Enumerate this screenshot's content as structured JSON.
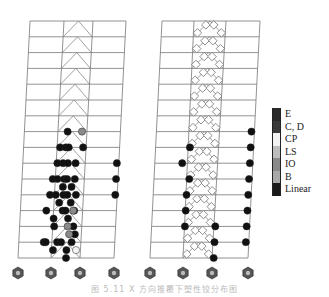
{
  "figure": {
    "caption": "图 5.11  X 方向推覆下塑性铰分布图",
    "stories": 15,
    "floor_top_y": 21,
    "floor_spacing": 15.8,
    "support_y": 273
  },
  "frames": [
    {
      "name": "left-frame",
      "top_cols": [
        30,
        64,
        93,
        126
      ],
      "bottom_cols": [
        18,
        51,
        80,
        114
      ],
      "brace_type": "chevron",
      "hinges": [
        {
          "story": 7,
          "x": 0.45,
          "s": "Linear"
        },
        {
          "story": 7,
          "x": 0.6,
          "s": "IO"
        },
        {
          "story": 8,
          "x": 0.38,
          "s": "Linear"
        },
        {
          "story": 8,
          "x": 0.44,
          "s": "Linear"
        },
        {
          "story": 8,
          "x": 0.47,
          "s": "Linear"
        },
        {
          "story": 8,
          "x": 0.62,
          "s": "Linear"
        },
        {
          "story": 9,
          "x": 0.36,
          "s": "Linear"
        },
        {
          "story": 9,
          "x": 0.42,
          "s": "Linear"
        },
        {
          "story": 9,
          "x": 0.47,
          "s": "Linear"
        },
        {
          "story": 9,
          "x": 0.55,
          "s": "Linear"
        },
        {
          "story": 9,
          "x": 0.98,
          "s": "Linear"
        },
        {
          "story": 10,
          "x": 0.32,
          "s": "Linear"
        },
        {
          "story": 10,
          "x": 0.37,
          "s": "Linear"
        },
        {
          "story": 10,
          "x": 0.44,
          "s": "Linear"
        },
        {
          "story": 10,
          "x": 0.47,
          "s": "Linear"
        },
        {
          "story": 10,
          "x": 0.55,
          "s": "Linear"
        },
        {
          "story": 10,
          "x": 0.98,
          "s": "Linear"
        },
        {
          "story": 10.5,
          "x": 0.43,
          "s": "Linear"
        },
        {
          "story": 10.5,
          "x": 0.52,
          "s": "Linear"
        },
        {
          "story": 11,
          "x": 0.3,
          "s": "Linear"
        },
        {
          "story": 11,
          "x": 0.36,
          "s": "Linear"
        },
        {
          "story": 11,
          "x": 0.44,
          "s": "Linear"
        },
        {
          "story": 11,
          "x": 0.48,
          "s": "Linear"
        },
        {
          "story": 11,
          "x": 0.57,
          "s": "Linear"
        },
        {
          "story": 11,
          "x": 0.98,
          "s": "Linear"
        },
        {
          "story": 11.5,
          "x": 0.4,
          "s": "Linear"
        },
        {
          "story": 11.5,
          "x": 0.52,
          "s": "Linear"
        },
        {
          "story": 12,
          "x": 0.27,
          "s": "Linear"
        },
        {
          "story": 12,
          "x": 0.44,
          "s": "Linear"
        },
        {
          "story": 12,
          "x": 0.47,
          "s": "Linear"
        },
        {
          "story": 12,
          "x": 0.56,
          "s": "Linear"
        },
        {
          "story": 12,
          "x": 0.55,
          "s": "IO"
        },
        {
          "story": 12.5,
          "x": 0.35,
          "s": "Linear"
        },
        {
          "story": 12.5,
          "x": 0.5,
          "s": "Linear"
        },
        {
          "story": 13,
          "x": 0.56,
          "s": "Linear"
        },
        {
          "story": 13,
          "x": 0.5,
          "s": "IO"
        },
        {
          "story": 13,
          "x": 0.36,
          "s": "Linear"
        },
        {
          "story": 13.5,
          "x": 0.58,
          "s": "Linear"
        },
        {
          "story": 13.5,
          "x": 0.52,
          "s": "IO"
        },
        {
          "story": 14,
          "x": 0.26,
          "s": "Linear"
        },
        {
          "story": 14,
          "x": 0.28,
          "s": "Linear"
        },
        {
          "story": 14,
          "x": 0.4,
          "s": "Linear"
        },
        {
          "story": 14,
          "x": 0.44,
          "s": "Linear"
        },
        {
          "story": 14,
          "x": 0.55,
          "s": "Linear"
        },
        {
          "story": 14.5,
          "x": 0.36,
          "s": "Linear"
        },
        {
          "story": 14.5,
          "x": 0.5,
          "s": "Linear"
        },
        {
          "story": 14.5,
          "x": 0.6,
          "s": "CP"
        },
        {
          "story": 15.5,
          "x": 0.5,
          "s": "Linear"
        }
      ]
    },
    {
      "name": "right-frame",
      "top_cols": [
        162,
        194,
        226,
        260
      ],
      "bottom_cols": [
        150,
        183,
        212,
        248
      ],
      "brace_type": "chevron-dense",
      "hinges": [
        {
          "story": 7,
          "x": 0.97,
          "s": "Linear"
        },
        {
          "story": 8,
          "x": 0.97,
          "s": "Linear"
        },
        {
          "story": 8,
          "x": 0.35,
          "s": "Linear"
        },
        {
          "story": 9,
          "x": 0.97,
          "s": "Linear"
        },
        {
          "story": 9,
          "x": 0.28,
          "s": "Linear"
        },
        {
          "story": 10,
          "x": 0.97,
          "s": "Linear"
        },
        {
          "story": 10,
          "x": 0.36,
          "s": "Linear"
        },
        {
          "story": 11,
          "x": 0.97,
          "s": "Linear"
        },
        {
          "story": 11,
          "x": 0.34,
          "s": "Linear"
        },
        {
          "story": 12,
          "x": 0.97,
          "s": "Linear"
        },
        {
          "story": 12,
          "x": 0.34,
          "s": "Linear"
        },
        {
          "story": 13,
          "x": 0.97,
          "s": "Linear"
        },
        {
          "story": 13,
          "x": 0.34,
          "s": "Linear"
        },
        {
          "story": 13,
          "x": 0.65,
          "s": "Linear"
        },
        {
          "story": 14,
          "x": 0.97,
          "s": "Linear"
        },
        {
          "story": 14,
          "x": 0.65,
          "s": "Linear"
        },
        {
          "story": 15,
          "x": 0.65,
          "s": "Linear"
        }
      ]
    }
  ],
  "legend": {
    "items": [
      {
        "label": "E",
        "color": "#2a2a2a"
      },
      {
        "label": "C, D",
        "color": "#3a3a3a"
      },
      {
        "label": "CP",
        "color": "#f2f2f2"
      },
      {
        "label": "LS",
        "color": "#bdbdbd"
      },
      {
        "label": "IO",
        "color": "#8a8a8a"
      },
      {
        "label": "B",
        "color": "#a8a8a8"
      },
      {
        "label": "Linear",
        "color": "#1a1a1a"
      }
    ]
  },
  "colors": {
    "frame_line": "#777777",
    "brace_line": "#888888",
    "hinge_dark": "#111111",
    "support": "#555555"
  }
}
